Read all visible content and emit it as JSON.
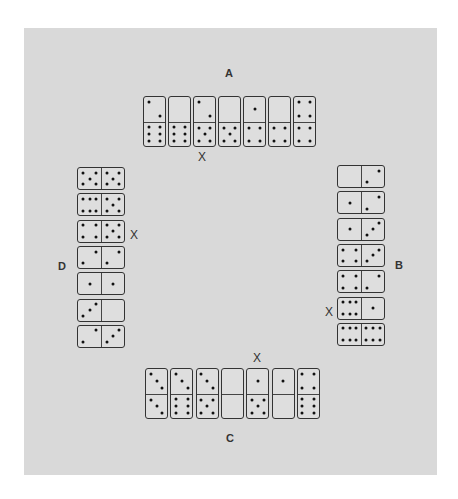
{
  "labels": {
    "A": "A",
    "B": "B",
    "C": "C",
    "D": "D"
  },
  "marker": "X",
  "rows": {
    "A": {
      "orientation": "vertical",
      "dominoes": [
        [
          2,
          6
        ],
        [
          0,
          6
        ],
        [
          2,
          5
        ],
        [
          0,
          5
        ],
        [
          1,
          4
        ],
        [
          0,
          4
        ],
        [
          4,
          4
        ]
      ],
      "marked_index": 2
    },
    "B": {
      "orientation": "horizontal",
      "dominoes": [
        [
          0,
          2
        ],
        [
          1,
          2
        ],
        [
          1,
          3
        ],
        [
          4,
          3
        ],
        [
          4,
          2
        ],
        [
          6,
          1
        ],
        [
          6,
          6
        ]
      ],
      "marked_index": 5
    },
    "C": {
      "orientation": "vertical",
      "dominoes": [
        [
          3,
          3
        ],
        [
          3,
          6
        ],
        [
          3,
          5
        ],
        [
          0,
          0
        ],
        [
          1,
          5
        ],
        [
          1,
          0
        ],
        [
          4,
          6
        ]
      ],
      "marked_index": 4
    },
    "D": {
      "orientation": "horizontal",
      "dominoes": [
        [
          5,
          5
        ],
        [
          6,
          5
        ],
        [
          4,
          5
        ],
        [
          2,
          2
        ],
        [
          1,
          1
        ],
        [
          3,
          0
        ],
        [
          2,
          3
        ]
      ],
      "marked_index": 2
    }
  },
  "colors": {
    "panel": "#d9d9d9",
    "ink": "#111111"
  }
}
